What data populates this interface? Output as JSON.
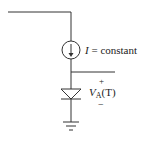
{
  "diagram": {
    "type": "circuit",
    "current_source": {
      "symbol": "I",
      "label_rest": " = constant"
    },
    "diode_voltage": {
      "plus": "+",
      "minus": "−",
      "symbol": "V",
      "subscript": "A",
      "argument": "(T)"
    },
    "colors": {
      "stroke": "#333333",
      "text": "#222222"
    }
  }
}
